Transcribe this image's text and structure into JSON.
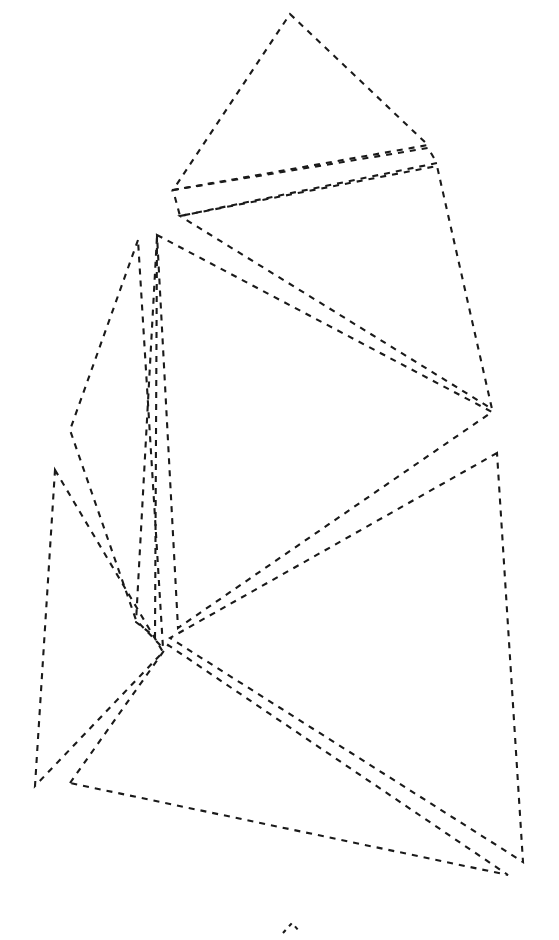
{
  "figure": {
    "width": 559,
    "height": 940,
    "background_color": "#ffffff",
    "stroke_color": "#1a1a1a",
    "stroke_width": 2.1,
    "dash_pattern": "6 6",
    "fill": "none",
    "shape_count": 8,
    "labels_present": "none",
    "axes_present": "none"
  },
  "shapes": [
    {
      "name": "top-triangle",
      "type": "polygon",
      "closed": true,
      "points": "290,14 428,145 173,190"
    },
    {
      "name": "upper-sliver-wedge",
      "type": "polygon",
      "closed": true,
      "points": "173,190 428,148 437,163 180,216"
    },
    {
      "name": "right-upper-triangle",
      "type": "polygon",
      "closed": true,
      "points": "180,216 437,166 492,409"
    },
    {
      "name": "central-wedge-triangle",
      "type": "polygon",
      "closed": true,
      "points": "157,235 492,412 178,628"
    },
    {
      "name": "left-narrow-sliver",
      "type": "polygon",
      "closed": true,
      "points": "157,236 155,637 136,622"
    },
    {
      "name": "left-kite-polygon",
      "type": "polygon",
      "closed": true,
      "points": "138,240 70,430 136,620 163,648"
    },
    {
      "name": "lower-left-triangle",
      "type": "polygon",
      "closed": true,
      "points": "55,470 163,652 35,786"
    },
    {
      "name": "bottom-long-triangle",
      "type": "polygon",
      "closed": true,
      "points": "70,783 168,645 508,875"
    },
    {
      "name": "right-tall-triangle",
      "type": "polygon",
      "closed": true,
      "points": "497,453 170,638 523,862"
    },
    {
      "name": "bottom-tick-mark",
      "type": "polyline",
      "closed": false,
      "points": "283,933 292,923 299,931"
    }
  ]
}
